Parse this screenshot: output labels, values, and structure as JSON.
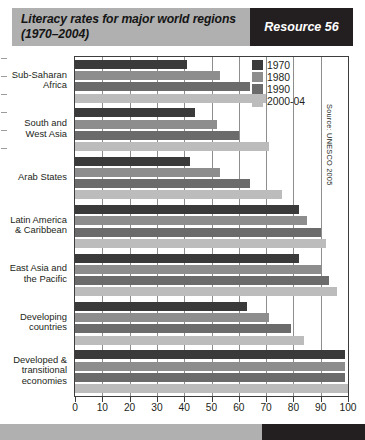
{
  "banner": {
    "title_line1": "Literacy rates for major world regions",
    "title_line2": "(1970–2004)",
    "badge": "Resource 56",
    "bg_color": "#b0b0b0",
    "badge_bg_color": "#231f20"
  },
  "source_note": "Source: UNESCO 2005",
  "legend": {
    "items": [
      {
        "label": "1970",
        "color": "#3a3a3a"
      },
      {
        "label": "1980",
        "color": "#8d8d8d"
      },
      {
        "label": "1990",
        "color": "#6b6b6b"
      },
      {
        "label": "2000-04",
        "color": "#bcbcbc"
      }
    ]
  },
  "chart_data": {
    "type": "bar",
    "orientation": "horizontal",
    "title": "Literacy rates for major world regions (1970–2004)",
    "xlabel": "",
    "ylabel": "",
    "xlim": [
      0,
      100
    ],
    "xticks": [
      0,
      10,
      20,
      30,
      40,
      50,
      60,
      70,
      80,
      90,
      100
    ],
    "grid": true,
    "legend_position": "top-right",
    "categories": [
      "Sub-Saharan Africa",
      "South and West Asia",
      "Arab States",
      "Latin America & Caribbean",
      "East Asia and the Pacific",
      "Developing countries",
      "Developed & transitional economies"
    ],
    "category_labels": [
      [
        "Sub-Saharan",
        "Africa"
      ],
      [
        "South and",
        "West  Asia"
      ],
      [
        "Arab States"
      ],
      [
        "Latin America",
        "& Caribbean"
      ],
      [
        "East Asia and",
        "the Pacific"
      ],
      [
        "Developing",
        "countries"
      ],
      [
        "Developed &",
        "transitional",
        "economies"
      ]
    ],
    "series": [
      {
        "name": "1970",
        "color": "#3a3a3a",
        "values": [
          41,
          44,
          42,
          82,
          82,
          63,
          99
        ]
      },
      {
        "name": "1980",
        "color": "#8d8d8d",
        "values": [
          53,
          52,
          53,
          85,
          90,
          71,
          99
        ]
      },
      {
        "name": "1990",
        "color": "#6b6b6b",
        "values": [
          64,
          60,
          64,
          90,
          93,
          79,
          99
        ]
      },
      {
        "name": "2000-04",
        "color": "#bcbcbc",
        "values": [
          70,
          71,
          76,
          92,
          96,
          84,
          100
        ]
      }
    ]
  },
  "xtick_labels": [
    "0",
    "10",
    "20",
    "30",
    "40",
    "50",
    "60",
    "70",
    "80",
    "90",
    "100"
  ]
}
